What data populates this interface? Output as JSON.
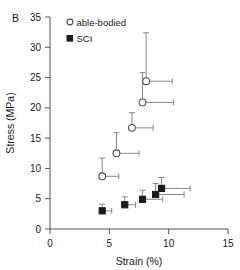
{
  "panel": {
    "label": "B"
  },
  "chart_data": {
    "type": "scatter",
    "title": "",
    "xlabel": "Strain (%)",
    "ylabel": "Stress (MPa)",
    "xlim": [
      0,
      15
    ],
    "ylim": [
      0,
      35
    ],
    "xticks": [
      0,
      5,
      10,
      15
    ],
    "yticks": [
      0,
      5,
      10,
      15,
      20,
      25,
      30,
      35
    ],
    "grid": false,
    "legend_position": "top-left-inside",
    "series": [
      {
        "name": "able-bodied",
        "marker": "open-circle",
        "color": "#4d4d4d",
        "x": [
          4.4,
          5.6,
          6.9,
          7.8,
          8.1
        ],
        "y": [
          8.7,
          12.5,
          16.7,
          20.9,
          24.4
        ],
        "x_err_upper": [
          1.4,
          1.9,
          1.8,
          2.6,
          2.2
        ],
        "x_err_lower": [
          0,
          0,
          0,
          0,
          0
        ],
        "y_err_upper": [
          3.0,
          3.4,
          2.5,
          4.9,
          8.0
        ],
        "y_err_lower": [
          0,
          0,
          0,
          0,
          0
        ]
      },
      {
        "name": "SCI",
        "marker": "filled-square",
        "color": "#1a1a1a",
        "x": [
          4.4,
          6.3,
          7.8,
          8.9,
          9.4
        ],
        "y": [
          3.0,
          4.0,
          4.9,
          5.7,
          6.7
        ],
        "x_err_upper": [
          0.8,
          0.9,
          1.7,
          2.4,
          2.4
        ],
        "x_err_lower": [
          0,
          0,
          0,
          0,
          0
        ],
        "y_err_upper": [
          1.1,
          1.3,
          1.5,
          1.8,
          1.8
        ],
        "y_err_lower": [
          0,
          0,
          0,
          0,
          0
        ]
      }
    ]
  },
  "legend": {
    "entries": [
      {
        "label": "able-bodied",
        "marker": "open-circle"
      },
      {
        "label": "SCI",
        "marker": "filled-square"
      }
    ]
  }
}
